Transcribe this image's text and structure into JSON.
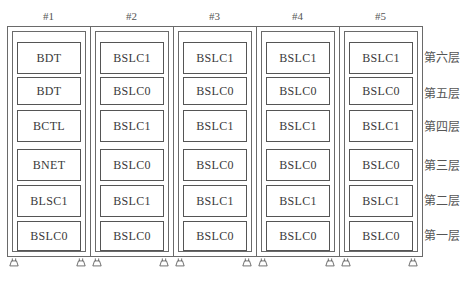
{
  "racks": [
    {
      "label": "#1",
      "modules": [
        "BDT",
        "BDT",
        "BCTL",
        "BNET",
        "BLSC1",
        "BSLC0"
      ]
    },
    {
      "label": "#2",
      "modules": [
        "BSLC1",
        "BSLC0",
        "BSLC1",
        "BSLC0",
        "BSLC1",
        "BSLC0"
      ]
    },
    {
      "label": "#3",
      "modules": [
        "BSLC1",
        "BSLC0",
        "BSLC1",
        "BSLC0",
        "BSLC1",
        "BSLC0"
      ]
    },
    {
      "label": "#4",
      "modules": [
        "BSLC1",
        "BSLC0",
        "BSLC1",
        "BSLC0",
        "BSLC1",
        "BSLC0"
      ]
    },
    {
      "label": "#5",
      "modules": [
        "BSLC1",
        "BSLC0",
        "BSLC1",
        "BSLC0",
        "BSLC1",
        "BSLC0"
      ]
    }
  ],
  "layers": [
    "第六层",
    "第五层",
    "第四层",
    "第三层",
    "第二层",
    "第一层"
  ],
  "colors": {
    "line": "#6a6a6a",
    "text": "#3a3a3a",
    "background": "#ffffff"
  }
}
